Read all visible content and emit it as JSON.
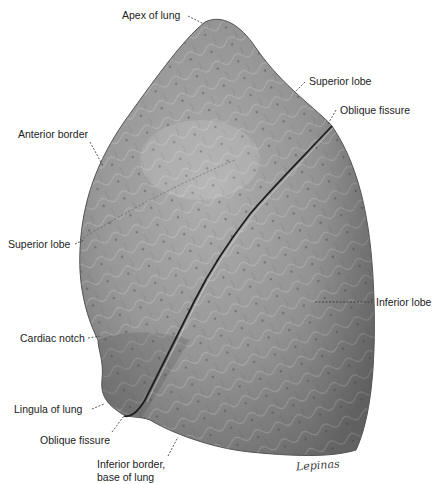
{
  "figure": {
    "signature": "Lepinas",
    "labels": [
      {
        "id": "apex",
        "text": "Apex of lung",
        "x": 122,
        "y": 9,
        "align": "left"
      },
      {
        "id": "superior-lobe-top",
        "text": "Superior lobe",
        "x": 309,
        "y": 75,
        "align": "left"
      },
      {
        "id": "oblique-fissure-top",
        "text": "Oblique fissure",
        "x": 340,
        "y": 104,
        "align": "left"
      },
      {
        "id": "anterior-border",
        "text": "Anterior border",
        "x": 18,
        "y": 128,
        "align": "left"
      },
      {
        "id": "superior-lobe-left",
        "text": "Superior lobe",
        "x": 8,
        "y": 238,
        "align": "left"
      },
      {
        "id": "inferior-lobe",
        "text": "Inferior lobe",
        "x": 376,
        "y": 298,
        "align": "left"
      },
      {
        "id": "cardiac-notch",
        "text": "Cardiac notch",
        "x": 20,
        "y": 332,
        "align": "left"
      },
      {
        "id": "lingula",
        "text": "Lingula of lung",
        "x": 14,
        "y": 403,
        "align": "left"
      },
      {
        "id": "oblique-fissure-bottom",
        "text": "Oblique fissure",
        "x": 40,
        "y": 435,
        "align": "left"
      },
      {
        "id": "inferior-border-1",
        "text": "Inferior border,",
        "x": 97,
        "y": 458,
        "align": "left"
      },
      {
        "id": "inferior-border-2",
        "text": "base of lung",
        "x": 97,
        "y": 471,
        "align": "left"
      }
    ],
    "colors": {
      "tissue_base": "#9a9a9a",
      "tissue_light": "#c4c4c4",
      "tissue_dark": "#5e5e5e",
      "fissure": "#1e1e1e",
      "leader": "#333333"
    }
  }
}
